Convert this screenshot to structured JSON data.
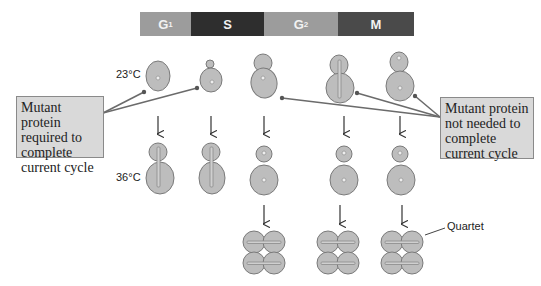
{
  "phases": [
    {
      "label": "G",
      "sub": "1",
      "color": "#9c9c9c"
    },
    {
      "label": "S",
      "sub": "",
      "color": "#2e2e2e"
    },
    {
      "label": "G",
      "sub": "2",
      "color": "#9c9c9c"
    },
    {
      "label": "M",
      "sub": "",
      "color": "#4a4a4a"
    }
  ],
  "labels": {
    "temp_low": "23°C",
    "temp_high": "36°C",
    "quartet": "Quartet"
  },
  "left_box": {
    "lines": [
      "Mutant protein",
      "required to",
      "complete",
      "current cycle"
    ]
  },
  "right_box": {
    "lines": [
      "Mutant protein",
      "not needed to",
      "complete",
      "current cycle"
    ]
  },
  "colors": {
    "cell_fill": "#bdbdbd",
    "cell_stroke": "#7a7a7a",
    "line": "#6b6b6b",
    "box_fill": "#d9d9d9"
  }
}
